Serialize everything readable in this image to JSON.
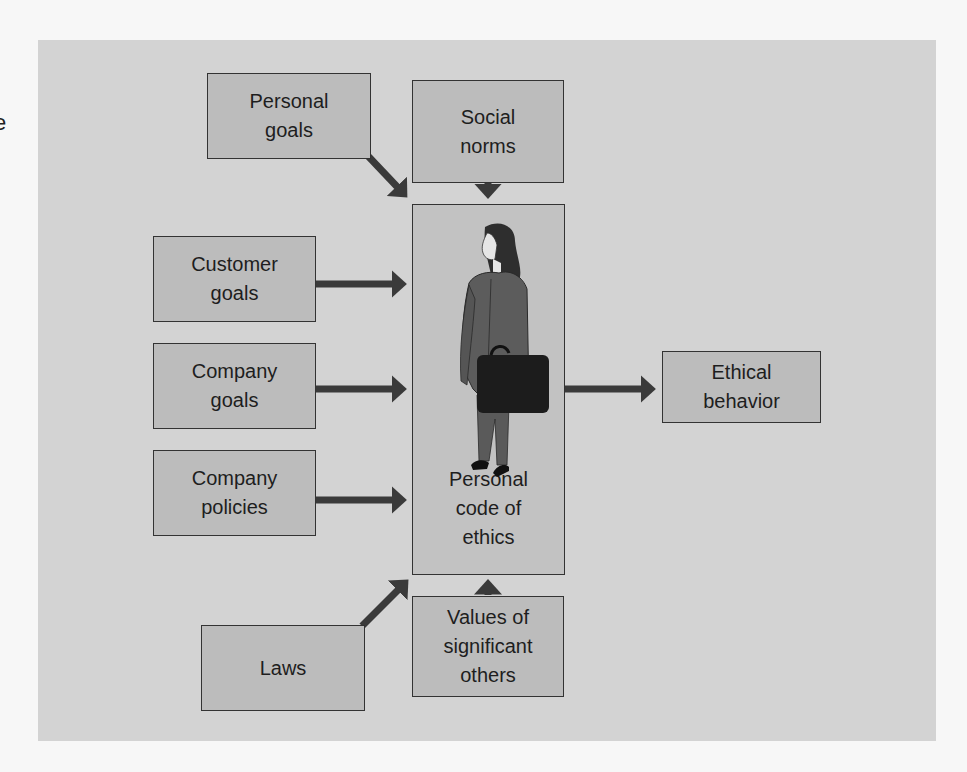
{
  "edge_fragment": "e",
  "diagram": {
    "center": {
      "label": "Personal\ncode of\nethics",
      "figure": "businesswoman-with-briefcase"
    },
    "inputs": [
      {
        "id": "personal-goals",
        "label": "Personal\ngoals"
      },
      {
        "id": "social-norms",
        "label": "Social\nnorms"
      },
      {
        "id": "customer-goals",
        "label": "Customer\ngoals"
      },
      {
        "id": "company-goals",
        "label": "Company\ngoals"
      },
      {
        "id": "company-policies",
        "label": "Company\npolicies"
      },
      {
        "id": "laws",
        "label": "Laws"
      },
      {
        "id": "values-of-significant-others",
        "label": "Values of\nsignificant\nothers"
      }
    ],
    "output": {
      "id": "ethical-behavior",
      "label": "Ethical\nbehavior"
    }
  },
  "colors": {
    "page_bg": "#f7f7f7",
    "panel_bg": "#d3d3d3",
    "box_fill": "#bcbcbc",
    "center_fill": "#c2c2c2",
    "arrow": "#3a3a3a",
    "border": "#333333"
  }
}
